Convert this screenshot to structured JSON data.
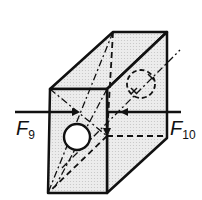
{
  "diagram": {
    "title": "",
    "forces": [
      {
        "symbol": "F",
        "subscript": "9",
        "side": "left",
        "direction": "right"
      },
      {
        "symbol": "F",
        "subscript": "10",
        "side": "right",
        "direction": "left"
      }
    ],
    "colors": {
      "stroke": "#111111",
      "fill": "#e8e8e8",
      "background": "#ffffff"
    }
  }
}
